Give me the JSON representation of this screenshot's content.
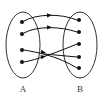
{
  "diagram": {
    "type": "set-mapping-diagram",
    "background_color": "#ffffff",
    "stroke_color": "#111111",
    "label_color": "#3d3d3d",
    "sets": [
      {
        "id": "A",
        "label": "A",
        "label_x": 23,
        "label_y": 92,
        "ellipse": {
          "cx": 23,
          "cy": 45,
          "rx": 17,
          "ry": 33
        },
        "element_count": 4,
        "elements": [
          {
            "id": "a1",
            "cx": 22,
            "cy": 22,
            "r": 2.0
          },
          {
            "id": "a2",
            "cx": 22,
            "cy": 34,
            "r": 2.0
          },
          {
            "id": "a3",
            "cx": 22,
            "cy": 50,
            "r": 2.0
          },
          {
            "id": "a4",
            "cx": 22,
            "cy": 62,
            "r": 2.0
          }
        ]
      },
      {
        "id": "B",
        "label": "B",
        "label_x": 80,
        "label_y": 92,
        "ellipse": {
          "cx": 80,
          "cy": 45,
          "rx": 17,
          "ry": 33
        },
        "element_count": 5,
        "elements": [
          {
            "id": "b1",
            "cx": 79,
            "cy": 20,
            "r": 2.0
          },
          {
            "id": "b2",
            "cx": 79,
            "cy": 32,
            "r": 2.0
          },
          {
            "id": "b3",
            "cx": 79,
            "cy": 44,
            "r": 2.0
          },
          {
            "id": "b4",
            "cx": 79,
            "cy": 57,
            "r": 2.0
          },
          {
            "id": "b5",
            "cx": 79,
            "cy": 68,
            "r": 2.0
          }
        ]
      }
    ],
    "edges": [
      {
        "id": "edge-a1-b1",
        "from": "a1",
        "to": "b1",
        "path": "M 24 21 C 36 14, 60 13, 77 20",
        "arrow": {
          "x": 47,
          "y": 15.2,
          "angle": -3
        }
      },
      {
        "id": "edge-a2-b2",
        "from": "a2",
        "to": "b2",
        "path": "M 24 33 C 36 26, 60 26, 77 32",
        "arrow": {
          "x": 47,
          "y": 27.2,
          "angle": -2
        }
      },
      {
        "id": "edge-a3-b4",
        "from": "a3",
        "to": "b4",
        "path": "M 24 50 C 36 52, 60 54, 77 57",
        "arrow": {
          "x": 44,
          "y": 52.0,
          "angle": 8
        }
      },
      {
        "id": "edge-a4-b3",
        "from": "a4",
        "to": "b3",
        "path": "M 24 62 C 36 59, 58 52, 77 44",
        "arrow": {
          "x": 44,
          "y": 56.8,
          "angle": -14
        }
      },
      {
        "id": "edge-cross-b5",
        "from": "a3",
        "to": "b5",
        "path": "M 40 50 C 54 56, 66 62, 77 68",
        "arrow": null
      }
    ],
    "crossing": {
      "present": true,
      "approx_x": 56,
      "approx_y": 53,
      "description": "lower edges cross in an X pattern between the sets"
    }
  }
}
